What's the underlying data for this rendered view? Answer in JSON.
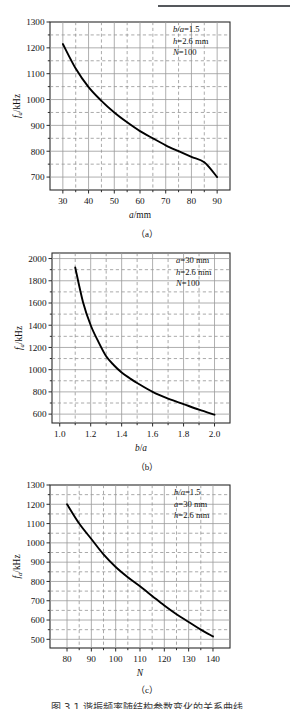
{
  "page": {
    "top_rule": "horizontal-rule",
    "bottom_caption_partial": "图 3.1  谐振频率随结构参数变化的关系曲线"
  },
  "figures": [
    {
      "id": "a",
      "subcaption": "（a）",
      "annotations": [
        "b/a=1.5",
        "h=2.6 mm",
        "N=100"
      ],
      "chart_data": {
        "type": "line",
        "title": "",
        "xlabel": "a/mm",
        "ylabel": "fa/kHz",
        "xlim": [
          25,
          95
        ],
        "ylim": [
          650,
          1300
        ],
        "xticks": [
          30,
          40,
          50,
          60,
          70,
          80,
          90
        ],
        "xticks_minor": [
          35,
          45,
          55,
          65,
          75,
          85
        ],
        "yticks": [
          700,
          800,
          900,
          1000,
          1100,
          1200,
          1300
        ],
        "yticks_minor": [
          750,
          850,
          950,
          1050,
          1150,
          1250
        ],
        "grid": true,
        "legend": "none",
        "x": [
          30,
          35,
          40,
          45,
          50,
          55,
          60,
          65,
          70,
          75,
          80,
          85,
          90
        ],
        "y": [
          1215,
          1120,
          1048,
          995,
          950,
          912,
          878,
          850,
          823,
          800,
          778,
          757,
          700
        ]
      }
    },
    {
      "id": "b",
      "subcaption": "（b）",
      "annotations": [
        "a=30 mm",
        "h=2.6 mm",
        "N=100"
      ],
      "chart_data": {
        "type": "line",
        "title": "",
        "xlabel": "b/a",
        "ylabel": "fa/kHz",
        "xlim": [
          0.95,
          2.1
        ],
        "ylim": [
          520,
          2050
        ],
        "xticks": [
          1.0,
          1.2,
          1.4,
          1.6,
          1.8,
          2.0
        ],
        "xticks_minor": [
          1.1,
          1.3,
          1.5,
          1.7,
          1.9
        ],
        "yticks": [
          600,
          800,
          1000,
          1200,
          1400,
          1600,
          1800,
          2000
        ],
        "yticks_minor": [
          700,
          900,
          1100,
          1300,
          1500,
          1700,
          1900
        ],
        "grid": true,
        "legend": "none",
        "x": [
          1.1,
          1.15,
          1.2,
          1.25,
          1.3,
          1.35,
          1.4,
          1.45,
          1.5,
          1.6,
          1.7,
          1.8,
          1.9,
          2.0
        ],
        "y": [
          1920,
          1610,
          1400,
          1250,
          1120,
          1040,
          975,
          925,
          880,
          800,
          740,
          690,
          640,
          595
        ]
      }
    },
    {
      "id": "c",
      "subcaption": "（c）",
      "annotations": [
        "b/a=1.5",
        "a=30 mm",
        "h=2.6 mm"
      ],
      "chart_data": {
        "type": "line",
        "title": "",
        "xlabel": "N",
        "ylabel": "fa/kHz",
        "xlim": [
          73,
          147
        ],
        "ylim": [
          455,
          1300
        ],
        "xticks": [
          80,
          90,
          100,
          110,
          120,
          130,
          140
        ],
        "xticks_minor": [
          85,
          95,
          105,
          115,
          125,
          135
        ],
        "yticks": [
          500,
          600,
          700,
          800,
          900,
          1000,
          1100,
          1200,
          1300
        ],
        "yticks_minor": [
          550,
          650,
          750,
          850,
          950,
          1050,
          1150,
          1250
        ],
        "grid": true,
        "legend": "none",
        "x": [
          80,
          85,
          90,
          95,
          100,
          105,
          110,
          115,
          120,
          125,
          130,
          135,
          140
        ],
        "y": [
          1200,
          1100,
          1020,
          940,
          875,
          822,
          775,
          725,
          675,
          630,
          590,
          550,
          515
        ]
      }
    }
  ]
}
